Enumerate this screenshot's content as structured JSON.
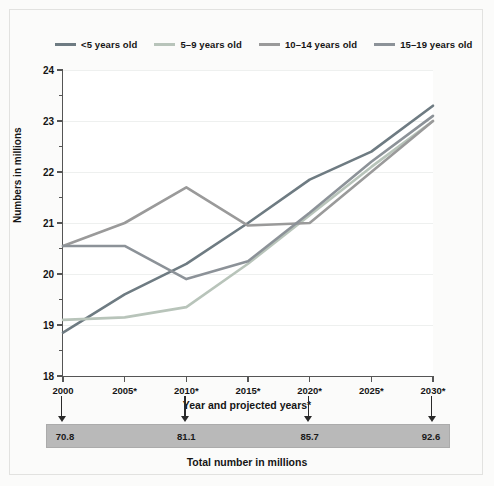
{
  "chart_data": {
    "type": "line",
    "title": "",
    "xlabel": "Year and projected years*",
    "ylabel": "Numbers in millions",
    "x": [
      "2000",
      "2005*",
      "2010*",
      "2015*",
      "2020*",
      "2025*",
      "2030*"
    ],
    "x_values": [
      2000,
      2005,
      2010,
      2015,
      2020,
      2025,
      2030
    ],
    "xlim": [
      2000,
      2030
    ],
    "ylim": [
      18,
      24
    ],
    "y_ticks": [
      18,
      19,
      20,
      21,
      22,
      23,
      24
    ],
    "y_minor_ticks": [
      18.5,
      19.5,
      20.5,
      21.5,
      22.5,
      23.5
    ],
    "grid": "horizontal",
    "legend_position": "top",
    "series": [
      {
        "name": "<5 years old",
        "color": "#6e7b82",
        "values": [
          18.85,
          19.6,
          20.2,
          21.0,
          21.85,
          22.4,
          23.3
        ]
      },
      {
        "name": "5–9 years old",
        "color": "#b8c4ba",
        "values": [
          19.1,
          19.15,
          19.35,
          20.2,
          21.15,
          22.1,
          23.0
        ]
      },
      {
        "name": "10–14 years old",
        "color": "#9a9a9a",
        "values": [
          20.55,
          21.0,
          21.7,
          20.95,
          21.0,
          22.0,
          23.0
        ]
      },
      {
        "name": "15–19 years old",
        "color": "#8c9298",
        "values": [
          20.55,
          20.55,
          19.9,
          20.25,
          21.2,
          22.2,
          23.1
        ]
      }
    ],
    "annotations": {
      "total_bar_caption": "Total number in millions",
      "total_bar_color": "#b9b9b9",
      "totals": [
        {
          "year": "2000",
          "value": "70.8"
        },
        {
          "year": "2010*",
          "value": "81.1"
        },
        {
          "year": "2020*",
          "value": "85.7"
        },
        {
          "year": "2030*",
          "value": "92.6"
        }
      ]
    }
  },
  "legend": {
    "items": [
      {
        "label": "<5 years old",
        "color": "#6e7b82"
      },
      {
        "label": "5–9 years old",
        "color": "#b8c4ba"
      },
      {
        "label": "10–14 years old",
        "color": "#9a9a9a"
      },
      {
        "label": "15–19 years old",
        "color": "#8c9298"
      }
    ]
  },
  "axes": {
    "y_title": "Numbers in millions",
    "x_title": "Year and projected years*",
    "y_tick_labels": [
      "24",
      "23",
      "22",
      "21",
      "20",
      "19",
      "18"
    ],
    "x_tick_labels": [
      "2000",
      "2005*",
      "2010*",
      "2015*",
      "2020*",
      "2025*",
      "2030*"
    ]
  },
  "total_bar": {
    "caption": "Total number in millions",
    "values": [
      "70.8",
      "81.1",
      "85.7",
      "92.6"
    ]
  }
}
